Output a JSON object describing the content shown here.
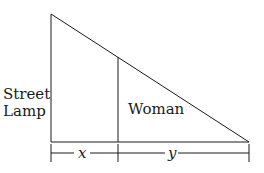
{
  "diagram": {
    "type": "similar-triangles",
    "labels": {
      "lamp_line1": "Street",
      "lamp_line2": "Lamp",
      "woman": "Woman",
      "x": "x",
      "y": "y"
    },
    "colors": {
      "stroke": "#1a1a1a",
      "background": "#ffffff"
    }
  }
}
